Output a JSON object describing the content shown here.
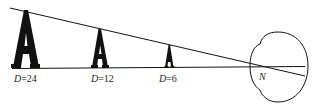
{
  "diagram": {
    "letters": [
      {
        "glyph": "A",
        "label_var": "D",
        "label_eq": "=24"
      },
      {
        "glyph": "A",
        "label_var": "D",
        "label_eq": "=12"
      },
      {
        "glyph": "A",
        "label_var": "D",
        "label_eq": "=6"
      }
    ],
    "eye": {
      "nodal_point_label": "N"
    },
    "colors": {
      "stroke": "#111111",
      "background": "#ffffff"
    }
  }
}
